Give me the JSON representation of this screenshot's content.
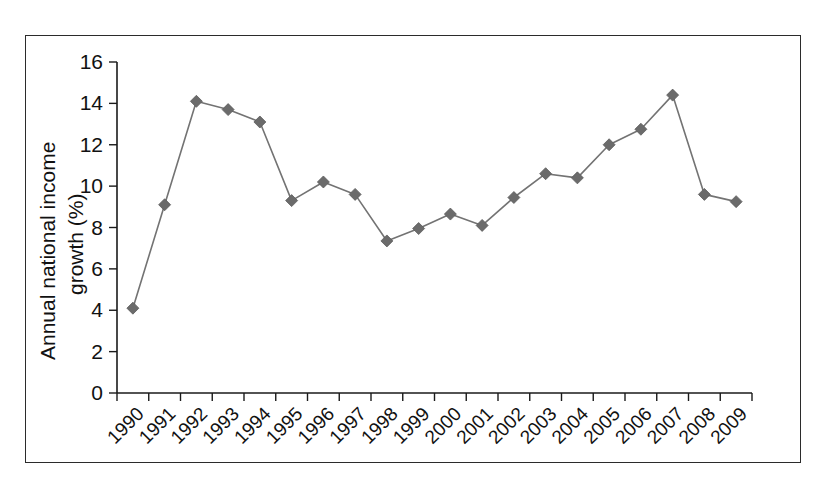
{
  "chart_data": {
    "type": "line",
    "title": "",
    "subtitle": "",
    "xlabel": "",
    "ylabel": "Annual national income growth (%)",
    "ylabel_lines": [
      "Annual national income",
      "growth (%)"
    ],
    "categories": [
      "1990",
      "1991",
      "1992",
      "1993",
      "1994",
      "1995",
      "1996",
      "1997",
      "1998",
      "1999",
      "2000",
      "2001",
      "2002",
      "2003",
      "2004",
      "2005",
      "2006",
      "2007",
      "2008",
      "2009"
    ],
    "values": [
      4.1,
      9.1,
      14.1,
      13.7,
      13.1,
      9.3,
      10.2,
      9.6,
      7.35,
      7.95,
      8.65,
      8.1,
      9.45,
      10.6,
      10.4,
      12.0,
      12.75,
      14.4,
      9.6,
      9.25
    ],
    "series": [
      {
        "name": "Annual national income growth",
        "values": [
          4.1,
          9.1,
          14.1,
          13.7,
          13.1,
          9.3,
          10.2,
          9.6,
          7.35,
          7.95,
          8.65,
          8.1,
          9.45,
          10.6,
          10.4,
          12.0,
          12.75,
          14.4,
          9.6,
          9.25
        ],
        "line_color": "#737373",
        "marker_color": "#6b6b6b",
        "marker_shape": "diamond"
      }
    ],
    "ylim": [
      0,
      16
    ],
    "ytick_labels": [
      "0",
      "2",
      "4",
      "6",
      "8",
      "10",
      "12",
      "14",
      "16"
    ],
    "ytick_values": [
      0,
      2,
      4,
      6,
      8,
      10,
      12,
      14,
      16
    ],
    "xtick_labels": [
      "1990",
      "1991",
      "1992",
      "1993",
      "1994",
      "1995",
      "1996",
      "1997",
      "1998",
      "1999",
      "2000",
      "2001",
      "2002",
      "2003",
      "2004",
      "2005",
      "2006",
      "2007",
      "2008",
      "2009"
    ],
    "xtick_rotation_deg": -45,
    "grid": false,
    "legend": false,
    "legend_position": "none",
    "axis_color": "#1a1a1a",
    "background_color": "#ffffff",
    "frame_border_color": "#2b2b2b",
    "annotations": []
  }
}
